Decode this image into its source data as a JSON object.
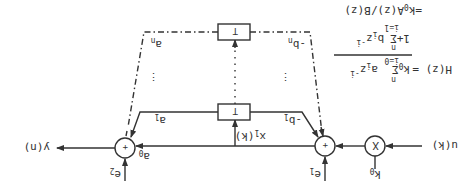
{
  "diagram": {
    "orientation": "rotated 180 degrees",
    "input_label": "u(k)",
    "output_label": "y(n)",
    "multiplier": {
      "symbol": "X",
      "gain": "k",
      "gain_sub": "0"
    },
    "adder_symbol": "+",
    "left_adder_error": {
      "base": "e",
      "sub": "1"
    },
    "right_adder_error": {
      "base": "e",
      "sub": "2"
    },
    "state_label": {
      "base": "x",
      "sub": "1",
      "arg": "(k)"
    },
    "delay_blocks": [
      "T",
      "T"
    ],
    "feedforward": {
      "a0": {
        "base": "a",
        "sub": "0"
      },
      "a1": {
        "base": "a",
        "sub": "1"
      },
      "an": {
        "base": "a",
        "sub": "n"
      }
    },
    "feedback": {
      "b1": {
        "base": "-b",
        "sub": "1"
      },
      "bn": {
        "base": "-b",
        "sub": "n"
      }
    },
    "dots": "⋮"
  },
  "formula": {
    "lhs": "H(z) =",
    "num_coef": "k",
    "num_coef_sub": "0",
    "sum": "Σ",
    "num_upper": "n",
    "num_lower": "i=0",
    "num_term": "a",
    "num_term_sub": "i",
    "num_z": "z",
    "num_exp": "-i",
    "den_prefix": "1+",
    "den_upper": "n",
    "den_lower": "i=1",
    "den_term": "b",
    "den_term_sub": "i",
    "den_z": "z",
    "den_exp": "-i",
    "second_line": "=k",
    "second_line_sub": "0",
    "second_line_rest": "A(z)/B(z)"
  }
}
